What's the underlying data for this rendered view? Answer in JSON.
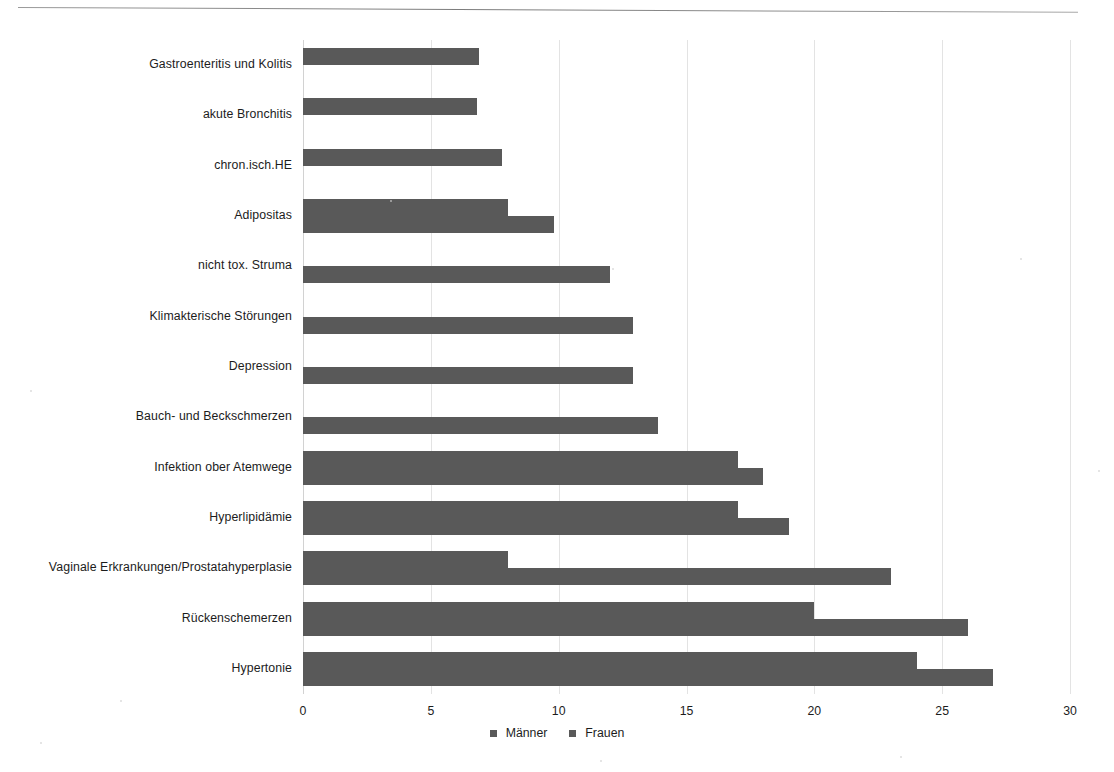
{
  "chart_data": {
    "type": "bar",
    "orientation": "horizontal",
    "title": "",
    "subtitle": "",
    "xlabel": "",
    "ylabel": "",
    "xlim": [
      0,
      30
    ],
    "xticks": [
      "0",
      "5",
      "10",
      "15",
      "20",
      "25",
      "30"
    ],
    "grid": true,
    "legend_position": "bottom-center",
    "bar_color": "#595959",
    "categories": [
      "Gastroenteritis und Kolitis",
      "akute Bronchitis",
      "chron.isch.HE",
      "Adipositas",
      "nicht tox. Struma",
      "Klimakterische Störungen",
      "Depression",
      "Bauch- und Beckschmerzen",
      "Infektion ober Atemwege",
      "Hyperlipidämie",
      "Vaginale Erkrankungen/Prostatahyperplasie",
      "Rückenschemerzen",
      "Hypertonie"
    ],
    "series": [
      {
        "name": "Männer",
        "color": "#595959",
        "values": [
          6.9,
          6.8,
          7.8,
          8.0,
          null,
          null,
          null,
          null,
          17.0,
          17.0,
          8.0,
          20.0,
          24.0
        ]
      },
      {
        "name": "Frauen",
        "color": "#595959",
        "values": [
          null,
          null,
          null,
          9.8,
          12.0,
          12.9,
          12.9,
          13.9,
          18.0,
          19.0,
          23.0,
          26.0,
          27.0
        ]
      }
    ]
  },
  "legend": {
    "entries": [
      {
        "label": "Männer",
        "swatch_name": "legend-swatch-maenner"
      },
      {
        "label": "Frauen",
        "swatch_name": "legend-swatch-frauen"
      }
    ]
  }
}
